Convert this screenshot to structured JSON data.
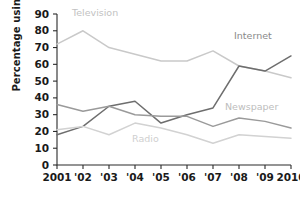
{
  "chart_data": {
    "type": "line",
    "title": "",
    "subtitle": "",
    "xlabel": "",
    "ylabel": "Percentage using",
    "categories": [
      "2001",
      "'02",
      "'03",
      "'04",
      "'05",
      "'06",
      "'07",
      "'08",
      "'09",
      "2010"
    ],
    "x": [
      2001,
      2002,
      2003,
      2004,
      2005,
      2006,
      2007,
      2008,
      2009,
      2010
    ],
    "ylim": [
      0,
      90
    ],
    "yticks": [
      0,
      10,
      20,
      30,
      40,
      50,
      60,
      70,
      80,
      90
    ],
    "grid": false,
    "legend_position": "inline-annotations",
    "series": [
      {
        "name": "Television",
        "color": "#c9c9c9",
        "values": [
          72,
          80,
          70,
          66,
          62,
          62,
          68,
          59,
          56,
          52
        ],
        "label_x_pct": 24,
        "label_y_pct": 8,
        "label_color": "#c2c2c2"
      },
      {
        "name": "Internet",
        "color": "#6e6e6e",
        "values": [
          18,
          23,
          35,
          38,
          25,
          30,
          34,
          59,
          56,
          65
        ],
        "label_x_pct": 78,
        "label_y_pct": 20,
        "label_color": "#8a8a8a"
      },
      {
        "name": "Newspaper",
        "color": "#9a9a9a",
        "values": [
          36,
          32,
          35,
          30,
          29,
          29,
          23,
          28,
          26,
          22
        ],
        "label_x_pct": 75,
        "label_y_pct": 56,
        "label_color": "#bdbdbd"
      },
      {
        "name": "Radio",
        "color": "#d2d2d2",
        "values": [
          21,
          23,
          18,
          25,
          22,
          18,
          13,
          18,
          17,
          16
        ],
        "label_x_pct": 44,
        "label_y_pct": 72,
        "label_color": "#cfcfcf"
      }
    ]
  },
  "axis": {
    "y_tick_labels": [
      "90",
      "80",
      "70",
      "60",
      "50",
      "40",
      "30",
      "20",
      "10",
      "0"
    ],
    "x_tick_labels": [
      "2001",
      "'02",
      "'03",
      "'04",
      "'05",
      "'06",
      "'07",
      "'08",
      "'09",
      "2010"
    ]
  }
}
